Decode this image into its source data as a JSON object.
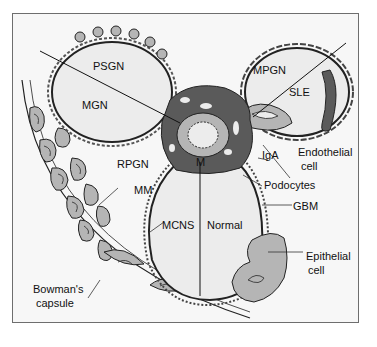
{
  "figure": {
    "frame_color": "#6e6e6e",
    "background": "#f7f7f7",
    "colors": {
      "capillary_lumen": "#ececec",
      "mesangium": "#5a5a5a",
      "cell_fill": "#b5b5b5",
      "outline": "#222222"
    }
  },
  "labels": {
    "psgn": "PSGN",
    "mgn": "MGN",
    "mpgn": "MPGN",
    "sle": "SLE",
    "rpgn": "RPGN",
    "mm": "MM",
    "m": "M",
    "iga": "IgA",
    "endothelial_1": "Endothelial",
    "endothelial_2": "cell",
    "podocytes": "Podocytes",
    "gbm": "GBM",
    "mcns": "MCNS",
    "normal": "Normal",
    "epithelial_1": "Epithelial",
    "epithelial_2": "cell",
    "bowmans_1": "Bowman's",
    "bowmans_2": "capsule"
  }
}
